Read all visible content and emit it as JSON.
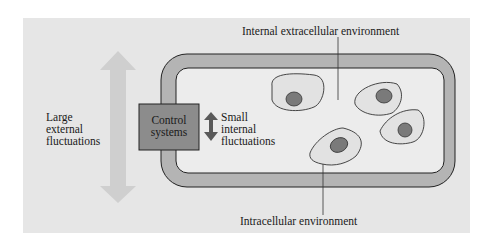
{
  "diagram": {
    "labels": {
      "internal_extracellular": "Internal extracellular environment",
      "intracellular": "Intracellular environment",
      "large_external": [
        "Large",
        "external",
        "fluctuations"
      ],
      "control_systems": [
        "Control",
        "systems"
      ],
      "small_internal": [
        "Small",
        "internal",
        "fluctuations"
      ]
    },
    "colors": {
      "background_panel": "#e6e6e6",
      "body_wall": "#b4b4b4",
      "interior": "#ececec",
      "control_box": "#8c8c8c",
      "nucleus": "#7a7a7a",
      "large_arrow": "#cfcfcf",
      "small_arrow": "#5a5a5a"
    },
    "cells_count": 5
  }
}
